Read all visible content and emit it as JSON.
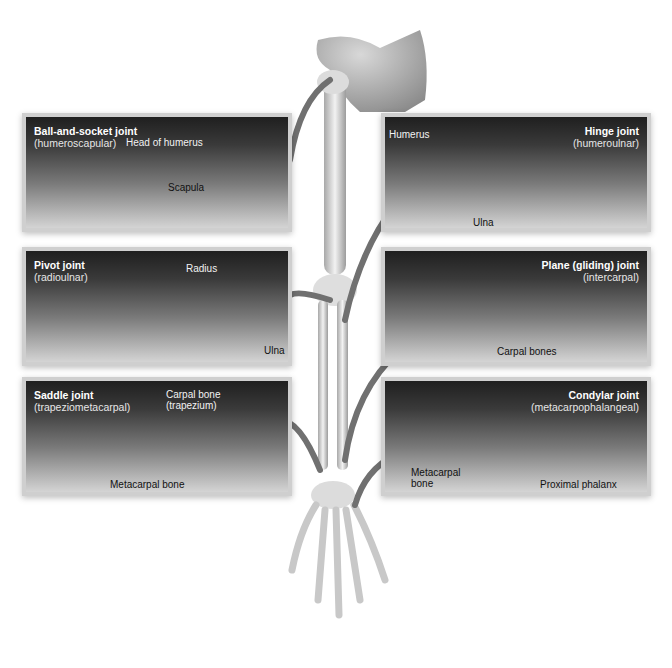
{
  "figure": {
    "panels": [
      {
        "id": "ball-and-socket",
        "title": "Ball-and-socket joint",
        "subtitle": "(humeroscapular)",
        "labels": [
          "Head of humerus",
          "Scapula"
        ]
      },
      {
        "id": "hinge",
        "title": "Hinge joint",
        "subtitle": "(humeroulnar)",
        "labels": [
          "Humerus",
          "Ulna"
        ]
      },
      {
        "id": "pivot",
        "title": "Pivot joint",
        "subtitle": "(radioulnar)",
        "labels": [
          "Radius",
          "Ulna"
        ]
      },
      {
        "id": "plane",
        "title": "Plane (gliding) joint",
        "subtitle": "(intercarpal)",
        "labels": [
          "Carpal bones"
        ]
      },
      {
        "id": "saddle",
        "title": "Saddle joint",
        "subtitle": "(trapeziometacarpal)",
        "labels": [
          "Carpal bone",
          "(trapezium)",
          "Metacarpal bone"
        ]
      },
      {
        "id": "condylar",
        "title": "Condylar joint",
        "subtitle": "(metacarpophalangeal)",
        "labels": [
          "Metacarpal",
          "bone",
          "Proximal phalanx"
        ]
      }
    ]
  },
  "colors": {
    "background": "#ffffff",
    "panel_top": "#1f1f1f",
    "panel_bottom": "#d4d4d4",
    "panel_border": "#cfcfcf",
    "bone": "#e9e9e9",
    "bone_shade": "#9a9a9a",
    "arrow": "#6f6f6f"
  }
}
